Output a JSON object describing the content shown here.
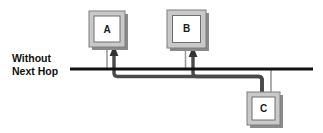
{
  "diagram": {
    "type": "network-topology",
    "background_color": "#ffffff",
    "caption": {
      "line1": "Without",
      "line2": "Next Hop"
    },
    "colors": {
      "bus_line": "#111111",
      "thick_path": "#4a4a4a",
      "thin_drop": "#9a9a9a",
      "node_border": "#9b9b9b",
      "node_inner_border": "#6f6f6f",
      "node_fill": "#ffffff",
      "node_shadow": "#8a8a8a",
      "label_text": "#1a1a1a"
    },
    "nodes": [
      {
        "id": "A",
        "label": "A",
        "x": 89,
        "y": 11,
        "width": 36,
        "height": 36
      },
      {
        "id": "B",
        "label": "B",
        "x": 167,
        "y": 10,
        "width": 39,
        "height": 38
      },
      {
        "id": "C",
        "label": "C",
        "x": 247,
        "y": 92,
        "width": 33,
        "height": 33
      }
    ],
    "bus": {
      "label": "horizontal-bus",
      "x_start": 70,
      "x_end": 313,
      "y": 69,
      "thickness": 3
    },
    "connections": [
      {
        "from": "A",
        "to": "bus",
        "style": "thin-drop"
      },
      {
        "from": "B",
        "to": "bus",
        "style": "thin-drop"
      },
      {
        "from": "C",
        "to": "bus",
        "style": "thin-drop"
      },
      {
        "from": "C",
        "to": "A",
        "style": "thick-routed-arrow",
        "direction": "up-into-A"
      },
      {
        "from": "C",
        "to": "B",
        "style": "thick-routed-arrow",
        "direction": "up-into-B"
      }
    ]
  }
}
